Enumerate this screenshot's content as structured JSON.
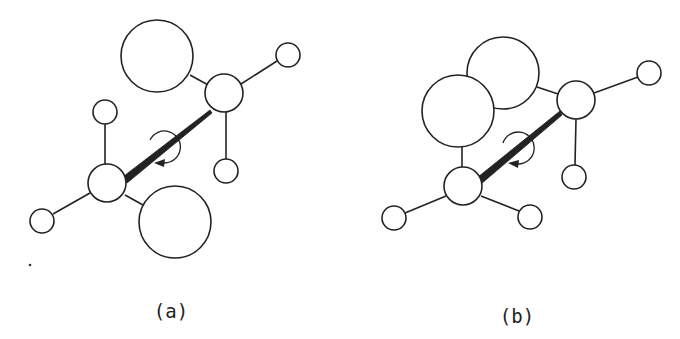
{
  "figure": {
    "panels": [
      {
        "id": "a",
        "label": "(a)",
        "description": "staggered conformation (anti), large substituents opposite"
      },
      {
        "id": "b",
        "label": "(b)",
        "description": "eclipsed/gauche conformation, large substituents close together"
      }
    ]
  },
  "colors": {
    "stroke": "#222222",
    "background": "#ffffff"
  }
}
